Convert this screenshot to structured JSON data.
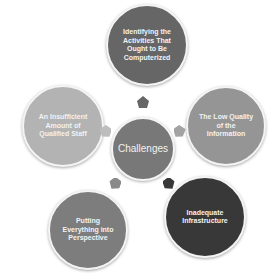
{
  "diagram": {
    "center": {
      "label": "Challenges",
      "color": "#787878"
    },
    "nodes": [
      {
        "id": "top",
        "label": "Identifying the Activities That Ought to Be Computerized",
        "color": "#666666"
      },
      {
        "id": "right",
        "label": "The Low Quality of the Information",
        "color": "#959595"
      },
      {
        "id": "bottom-right",
        "label": "Inadequate Infrastructure",
        "color": "#383838"
      },
      {
        "id": "bottom-left",
        "label": "Putting Everything into Perspective",
        "color": "#7d7d7d"
      },
      {
        "id": "left",
        "label": "An Insufficient Amount of Qualified Staff",
        "color": "#b3b3b3"
      }
    ],
    "arrows": [
      {
        "to": "top",
        "color": "#666666"
      },
      {
        "to": "right",
        "color": "#a3a3a3"
      },
      {
        "to": "bottom-right",
        "color": "#383838"
      },
      {
        "to": "bottom-left",
        "color": "#8a8a8a"
      },
      {
        "to": "left",
        "color": "#bdbdbd"
      }
    ]
  }
}
